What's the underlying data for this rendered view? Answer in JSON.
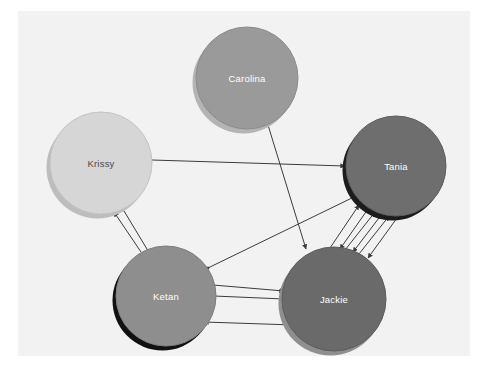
{
  "diagram": {
    "type": "directed-social-network-graph",
    "title": "",
    "canvas": {
      "background_color": "#f2f2f2",
      "page_background_color": "#ffffff",
      "x": 18,
      "y": 11,
      "width": 452,
      "height": 345
    },
    "edge_color": "#3c3c3c",
    "nodes": [
      {
        "id": "carolina",
        "label": "Carolina",
        "cx": 247,
        "cy": 78,
        "r": 51,
        "fill": "#9a9a9a",
        "stroke": "#8c8c8c",
        "shadow": "#b4b4b4",
        "label_color": "#ffffff"
      },
      {
        "id": "krissy",
        "label": "Krissy",
        "cx": 101,
        "cy": 163,
        "r": 51,
        "fill": "#d6d6d6",
        "stroke": "#c4c4c4",
        "shadow": "#bdbdbd",
        "label_color": "#4a4a4a"
      },
      {
        "id": "tania",
        "label": "Tania",
        "cx": 396,
        "cy": 166,
        "r": 50,
        "fill": "#6e6e6e",
        "stroke": "#5e5e5e",
        "shadow": "#1c1c1c",
        "label_color": "#ffffff"
      },
      {
        "id": "ketan",
        "label": "Ketan",
        "cx": 166,
        "cy": 296,
        "r": 50,
        "fill": "#8e8e8e",
        "stroke": "#7e7e7e",
        "shadow": "#111111",
        "label_color": "#ffffff"
      },
      {
        "id": "jackie",
        "label": "Jackie",
        "cx": 334,
        "cy": 299,
        "r": 52,
        "fill": "#6a6a6a",
        "stroke": "#5c5c5c",
        "shadow": "#8f8f8f",
        "label_color": "#ffffff"
      }
    ],
    "edges": [
      {
        "id": "krissy-tania",
        "from": "krissy",
        "to": "tania",
        "direction": "forward",
        "x1": 152,
        "y1": 160,
        "x2": 345,
        "y2": 166
      },
      {
        "id": "carolina-jackie",
        "from": "carolina",
        "to": "jackie",
        "direction": "forward",
        "x1": 268,
        "y1": 125,
        "x2": 306,
        "y2": 249
      },
      {
        "id": "krissy-ketan-a",
        "from": "ketan",
        "to": "krissy",
        "direction": "forward",
        "x1": 141,
        "y1": 252,
        "x2": 114,
        "y2": 212
      },
      {
        "id": "krissy-ketan-b",
        "from": "krissy",
        "to": "ketan",
        "direction": "both",
        "x1": 124,
        "y1": 211,
        "x2": 150,
        "y2": 254
      },
      {
        "id": "ketan-tania-long",
        "from": "ketan",
        "to": "tania",
        "direction": "both",
        "x1": 210,
        "y1": 267,
        "x2": 356,
        "y2": 196
      },
      {
        "id": "ketan-jackie-a",
        "from": "ketan",
        "to": "jackie",
        "direction": "forward",
        "x1": 213,
        "y1": 285,
        "x2": 284,
        "y2": 291
      },
      {
        "id": "ketan-jackie-b",
        "from": "ketan",
        "to": "jackie",
        "direction": "forward",
        "x1": 214,
        "y1": 296,
        "x2": 284,
        "y2": 299
      },
      {
        "id": "jackie-ketan-c",
        "from": "jackie",
        "to": "ketan",
        "direction": "forward",
        "x1": 294,
        "y1": 325,
        "x2": 204,
        "y2": 322
      },
      {
        "id": "jackie-tania-1",
        "from": "jackie",
        "to": "tania",
        "direction": "forward",
        "x1": 330,
        "y1": 248,
        "x2": 359,
        "y2": 205
      },
      {
        "id": "tania-jackie-2",
        "from": "tania",
        "to": "jackie",
        "direction": "forward",
        "x1": 368,
        "y1": 209,
        "x2": 340,
        "y2": 249
      },
      {
        "id": "jackie-tania-3",
        "from": "jackie",
        "to": "tania",
        "direction": "forward",
        "x1": 345,
        "y1": 250,
        "x2": 375,
        "y2": 212
      },
      {
        "id": "tania-jackie-4",
        "from": "tania",
        "to": "jackie",
        "direction": "forward",
        "x1": 382,
        "y1": 214,
        "x2": 353,
        "y2": 252
      },
      {
        "id": "jackie-tania-5",
        "from": "jackie",
        "to": "tania",
        "direction": "forward",
        "x1": 359,
        "y1": 254,
        "x2": 389,
        "y2": 216
      },
      {
        "id": "tania-jackie-6",
        "from": "tania",
        "to": "jackie",
        "direction": "forward",
        "x1": 397,
        "y1": 218,
        "x2": 368,
        "y2": 258
      }
    ]
  }
}
